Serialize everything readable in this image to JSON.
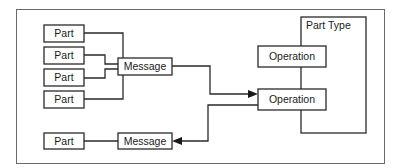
{
  "diagram": {
    "part_type": {
      "label": "Part Type"
    },
    "input_parts": [
      {
        "label": "Part"
      },
      {
        "label": "Part"
      },
      {
        "label": "Part"
      },
      {
        "label": "Part"
      }
    ],
    "input_message": {
      "label": "Message"
    },
    "output_part": {
      "label": "Part"
    },
    "output_message": {
      "label": "Message"
    },
    "operations": [
      {
        "label": "Operation"
      },
      {
        "label": "Operation"
      }
    ]
  }
}
